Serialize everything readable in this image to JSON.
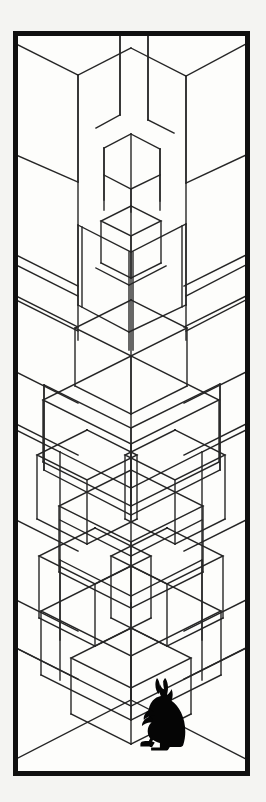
{
  "artwork": {
    "title": "Isometric Cube Tower with Rabbit",
    "medium": "line drawing",
    "orientation": "portrait",
    "background_color": "#f4f4f2",
    "paper_color": "#fdfdfb",
    "ink_color": "#111111",
    "line_color": "#262626",
    "silhouette_color": "#050505"
  },
  "frame": {
    "name": "black-border-frame",
    "x": 13,
    "y": 31,
    "width": 237,
    "height": 745,
    "stroke_width": 5,
    "color": "#101010"
  },
  "canvas": {
    "width": 266,
    "height": 802,
    "inner_x": 16,
    "inner_y": 34,
    "inner_width": 231,
    "inner_height": 739
  },
  "scene": {
    "description": "Stacked transparent isometric cubes forming an impossible tower inside a room corner",
    "subject": "rabbit-silhouette",
    "subject_position": {
      "x": 168,
      "y": 718
    },
    "vanishing_corner_x": 131,
    "floor_corner_y": 700
  },
  "chart_data": {
    "type": "line",
    "grid": false,
    "xlabel": "",
    "ylabel": "",
    "projection": "isometric",
    "iso_slope": 0.5,
    "stroke_width": 1.4,
    "line_color": "#262626",
    "frame": {
      "x": 13,
      "y": 31,
      "w": 237,
      "h": 745,
      "stroke": 5
    },
    "room": {
      "corner_x": 131,
      "wall_top_y": 34,
      "corner_bottom_y": 700,
      "floor_left_end": {
        "x": 16,
        "y": 762
      },
      "floor_right_end": {
        "x": 246,
        "y": 762
      },
      "left_wall_base_y": 762,
      "right_wall_base_y": 762
    },
    "polylines": [
      {
        "name": "wall-corner-vertical",
        "points": [
          [
            131,
            603
          ],
          [
            131,
            700
          ]
        ]
      },
      {
        "name": "floor-left-edge",
        "points": [
          [
            131,
            700
          ],
          [
            16,
            759
          ]
        ]
      },
      {
        "name": "floor-right-edge",
        "points": [
          [
            131,
            700
          ],
          [
            246,
            759
          ]
        ]
      },
      {
        "name": "top-left-cube-top-left",
        "points": [
          [
            16,
            44
          ],
          [
            78,
            75
          ]
        ]
      },
      {
        "name": "top-left-cube-top-right",
        "points": [
          [
            78,
            75
          ],
          [
            131,
            48
          ]
        ]
      },
      {
        "name": "top-left-cube-vert",
        "points": [
          [
            78,
            75
          ],
          [
            78,
            182
          ]
        ]
      },
      {
        "name": "top-left-cube-left-vert",
        "points": [
          [
            16,
            44
          ],
          [
            16,
            155
          ]
        ]
      },
      {
        "name": "top-left-cube-lower-left",
        "points": [
          [
            16,
            155
          ],
          [
            78,
            182
          ]
        ]
      },
      {
        "name": "top-right-cube-top-left",
        "points": [
          [
            131,
            48
          ],
          [
            186,
            76
          ]
        ]
      },
      {
        "name": "top-right-cube-top-right",
        "points": [
          [
            186,
            76
          ],
          [
            246,
            44
          ]
        ]
      },
      {
        "name": "top-right-cube-vert",
        "points": [
          [
            186,
            76
          ],
          [
            186,
            183
          ]
        ]
      },
      {
        "name": "top-right-cube-right-vert",
        "points": [
          [
            246,
            44
          ],
          [
            246,
            155
          ]
        ]
      },
      {
        "name": "top-right-cube-lower-right",
        "points": [
          [
            246,
            155
          ],
          [
            186,
            183
          ]
        ]
      },
      {
        "name": "center-gap-left-vert",
        "points": [
          [
            120,
            34
          ],
          [
            120,
            115
          ]
        ]
      },
      {
        "name": "center-gap-right-vert",
        "points": [
          [
            148,
            34
          ],
          [
            148,
            120
          ]
        ]
      },
      {
        "name": "center-gap-left-diag",
        "points": [
          [
            120,
            115
          ],
          [
            96,
            128
          ]
        ]
      },
      {
        "name": "center-gap-right-diag",
        "points": [
          [
            148,
            120
          ],
          [
            174,
            133
          ]
        ]
      },
      {
        "name": "small-cube-top-apex",
        "points": [
          [
            131,
            134
          ],
          [
            104,
            148
          ]
        ]
      },
      {
        "name": "small-cube-top-apex2",
        "points": [
          [
            131,
            134
          ],
          [
            160,
            149
          ]
        ]
      },
      {
        "name": "small-cube-left-vert",
        "points": [
          [
            104,
            148
          ],
          [
            104,
            200
          ]
        ]
      },
      {
        "name": "small-cube-right-vert",
        "points": [
          [
            160,
            149
          ],
          [
            160,
            201
          ]
        ]
      },
      {
        "name": "small-cube-bottom-left",
        "points": [
          [
            104,
            175
          ],
          [
            131,
            189
          ]
        ]
      },
      {
        "name": "small-cube-bottom-right",
        "points": [
          [
            131,
            189
          ],
          [
            160,
            175
          ]
        ]
      },
      {
        "name": "small-cube-center-vert",
        "points": [
          [
            131,
            189
          ],
          [
            131,
            212
          ]
        ]
      },
      {
        "name": "mid-cube-top-left",
        "points": [
          [
            78,
            225
          ],
          [
            131,
            252
          ]
        ]
      },
      {
        "name": "mid-cube-top-right",
        "points": [
          [
            131,
            252
          ],
          [
            186,
            224
          ]
        ]
      },
      {
        "name": "mid-cube-left-vert-a",
        "points": [
          [
            78,
            225
          ],
          [
            78,
            305
          ]
        ]
      },
      {
        "name": "mid-cube-left-vert-b",
        "points": [
          [
            82,
            227
          ],
          [
            82,
            307
          ]
        ]
      },
      {
        "name": "mid-cube-right-vert-a",
        "points": [
          [
            186,
            224
          ],
          [
            186,
            305
          ]
        ]
      },
      {
        "name": "mid-cube-right-vert-b",
        "points": [
          [
            182,
            226
          ],
          [
            182,
            307
          ]
        ]
      },
      {
        "name": "mid-cube-center-vert-a",
        "points": [
          [
            129,
            252
          ],
          [
            129,
            350
          ]
        ]
      },
      {
        "name": "mid-cube-center-vert-b",
        "points": [
          [
            133,
            252
          ],
          [
            133,
            350
          ]
        ]
      },
      {
        "name": "mid-cube-inner-left",
        "points": [
          [
            96,
            268
          ],
          [
            129,
            285
          ]
        ]
      },
      {
        "name": "mid-cube-inner-right",
        "points": [
          [
            129,
            285
          ],
          [
            166,
            266
          ]
        ]
      },
      {
        "name": "mid-cube-bottom-left",
        "points": [
          [
            78,
            305
          ],
          [
            129,
            332
          ]
        ]
      },
      {
        "name": "mid-cube-bottom-right",
        "points": [
          [
            129,
            332
          ],
          [
            186,
            305
          ]
        ]
      },
      {
        "name": "wide-cube-top-left",
        "points": [
          [
            44,
            385
          ],
          [
            131,
            428
          ]
        ]
      },
      {
        "name": "wide-cube-top-right",
        "points": [
          [
            131,
            428
          ],
          [
            220,
            384
          ]
        ]
      },
      {
        "name": "wide-cube-left-vert",
        "points": [
          [
            44,
            385
          ],
          [
            44,
            470
          ]
        ]
      },
      {
        "name": "wide-cube-right-vert",
        "points": [
          [
            220,
            384
          ],
          [
            220,
            470
          ]
        ]
      },
      {
        "name": "wide-cube-center-vert",
        "points": [
          [
            131,
            428
          ],
          [
            131,
            520
          ]
        ]
      },
      {
        "name": "wide-cube-bottom-left",
        "points": [
          [
            44,
            470
          ],
          [
            131,
            515
          ]
        ]
      },
      {
        "name": "wide-cube-bottom-right",
        "points": [
          [
            131,
            515
          ],
          [
            220,
            470
          ]
        ]
      },
      {
        "name": "left-band-1a",
        "points": [
          [
            16,
            265
          ],
          [
            78,
            296
          ]
        ]
      },
      {
        "name": "left-band-1b",
        "points": [
          [
            16,
            300
          ],
          [
            78,
            331
          ]
        ]
      },
      {
        "name": "right-band-1a",
        "points": [
          [
            246,
            265
          ],
          [
            186,
            296
          ]
        ]
      },
      {
        "name": "right-band-1b",
        "points": [
          [
            246,
            300
          ],
          [
            186,
            331
          ]
        ]
      },
      {
        "name": "left-band-2a",
        "points": [
          [
            16,
            430
          ],
          [
            60,
            452
          ]
        ]
      },
      {
        "name": "right-band-2a",
        "points": [
          [
            246,
            430
          ],
          [
            202,
            452
          ]
        ]
      },
      {
        "name": "cross-left-up",
        "points": [
          [
            60,
            452
          ],
          [
            131,
            488
          ]
        ]
      },
      {
        "name": "cross-right-up",
        "points": [
          [
            202,
            452
          ],
          [
            131,
            488
          ]
        ]
      },
      {
        "name": "cross-left-dn",
        "points": [
          [
            60,
            520
          ],
          [
            131,
            556
          ]
        ]
      },
      {
        "name": "cross-right-dn",
        "points": [
          [
            202,
            520
          ],
          [
            131,
            556
          ]
        ]
      },
      {
        "name": "low-cube-top-left",
        "points": [
          [
            60,
            560
          ],
          [
            131,
            596
          ]
        ]
      },
      {
        "name": "low-cube-top-right",
        "points": [
          [
            131,
            596
          ],
          [
            202,
            560
          ]
        ]
      },
      {
        "name": "low-cube-left-vert",
        "points": [
          [
            60,
            560
          ],
          [
            60,
            640
          ]
        ]
      },
      {
        "name": "low-cube-right-vert",
        "points": [
          [
            202,
            560
          ],
          [
            202,
            640
          ]
        ]
      },
      {
        "name": "floor-panel-left",
        "points": [
          [
            16,
            648
          ],
          [
            131,
            706
          ]
        ]
      },
      {
        "name": "floor-panel-right",
        "points": [
          [
            246,
            648
          ],
          [
            131,
            706
          ]
        ]
      },
      {
        "name": "left-wall-vert-low",
        "points": [
          [
            16,
            648
          ],
          [
            16,
            762
          ]
        ]
      },
      {
        "name": "right-wall-vert-low",
        "points": [
          [
            246,
            648
          ],
          [
            246,
            762
          ]
        ]
      }
    ],
    "verticals": [
      {
        "x": 16,
        "y1": 34,
        "y2": 762
      },
      {
        "x": 44,
        "y1": 385,
        "y2": 470
      },
      {
        "x": 60,
        "y1": 452,
        "y2": 680
      },
      {
        "x": 78,
        "y1": 75,
        "y2": 340
      },
      {
        "x": 104,
        "y1": 148,
        "y2": 210
      },
      {
        "x": 120,
        "y1": 34,
        "y2": 115
      },
      {
        "x": 131,
        "y1": 134,
        "y2": 700
      },
      {
        "x": 148,
        "y1": 34,
        "y2": 120
      },
      {
        "x": 160,
        "y1": 149,
        "y2": 210
      },
      {
        "x": 186,
        "y1": 76,
        "y2": 340
      },
      {
        "x": 202,
        "y1": 452,
        "y2": 680
      },
      {
        "x": 220,
        "y1": 385,
        "y2": 470
      },
      {
        "x": 246,
        "y1": 34,
        "y2": 762
      }
    ],
    "rabbit": {
      "name": "rabbit-silhouette",
      "fill": "#050505",
      "bbox": {
        "x": 148,
        "y": 678,
        "w": 42,
        "h": 72
      },
      "facing": "left",
      "pose": "sitting upright"
    }
  }
}
